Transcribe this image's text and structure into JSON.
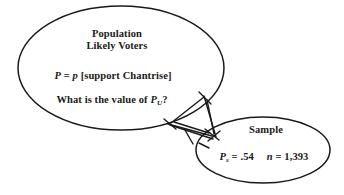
{
  "diagram": {
    "type": "venn-population-sample",
    "background_color": "#ffffff",
    "stroke_color": "#1a1a1a",
    "population": {
      "title_line1": "Population",
      "title_line2": "Likely Voters",
      "formula_prefix": "P",
      "formula_middle": " = ",
      "formula_italic_p": "p",
      "formula_suffix": " [support Chantrise]",
      "question_prefix": "What is the value of ",
      "question_symbol": "P",
      "question_subscript": "U",
      "question_suffix": "?",
      "ellipse": {
        "cx": 121,
        "cy": 68,
        "rx": 103,
        "ry": 62
      }
    },
    "sample": {
      "title": "Sample",
      "proportion_symbol": "P",
      "proportion_subscript": "s",
      "proportion_value": " = .54",
      "n_symbol": "n",
      "n_value": " = 1,393",
      "ellipse": {
        "cx": 263,
        "cy": 150,
        "rx": 67,
        "ry": 33
      }
    },
    "connector": {
      "name": "arrow-connector",
      "description": "two crossing tick-marked lines linking population to sample"
    }
  }
}
